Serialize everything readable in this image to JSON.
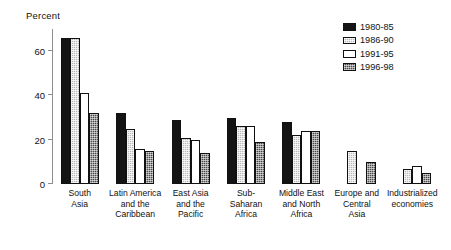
{
  "axis": {
    "y_title": "Percent",
    "y_ticks": [
      "0",
      "20",
      "40",
      "60"
    ]
  },
  "legend": {
    "items": [
      {
        "label": "1980-85",
        "swatch": "solid-black-swatch",
        "fill": "#141414"
      },
      {
        "label": "1986-90",
        "swatch": "light-grey-hatch-swatch",
        "fill": "#b9b9b9"
      },
      {
        "label": "1991-95",
        "swatch": "white-swatch",
        "fill": "#ffffff"
      },
      {
        "label": "1996-98",
        "swatch": "dark-grey-hatch-swatch",
        "fill": "#4a4a4a"
      }
    ]
  },
  "categories": [
    "South\nAsia",
    "Latin America\nand the\nCaribbean",
    "East Asia\nand the\nPacific",
    "Sub-\nSaharan\nAfrica",
    "Middle East\nand North\nAfrica",
    "Europe and\nCentral\nAsia",
    "Industrialized\neconomies"
  ],
  "chart_data": {
    "type": "bar",
    "title": "",
    "xlabel": "",
    "ylabel": "Percent",
    "ylim": [
      0,
      70
    ],
    "yticks": [
      0,
      20,
      40,
      60
    ],
    "grid": false,
    "legend_position": "top-right",
    "categories": [
      "South Asia",
      "Latin America and the Caribbean",
      "East Asia and the Pacific",
      "Sub-Saharan Africa",
      "Middle East and North Africa",
      "Europe and Central Asia",
      "Industrialized economies"
    ],
    "series": [
      {
        "name": "1980-85",
        "values": [
          66,
          32,
          29,
          30,
          28,
          null,
          null
        ]
      },
      {
        "name": "1986-90",
        "values": [
          66,
          25,
          21,
          26,
          22,
          15,
          7
        ]
      },
      {
        "name": "1991-95",
        "values": [
          41,
          16,
          20,
          26,
          24,
          null,
          8
        ]
      },
      {
        "name": "1996-98",
        "values": [
          32,
          15,
          14,
          19,
          24,
          10,
          5
        ]
      }
    ]
  }
}
